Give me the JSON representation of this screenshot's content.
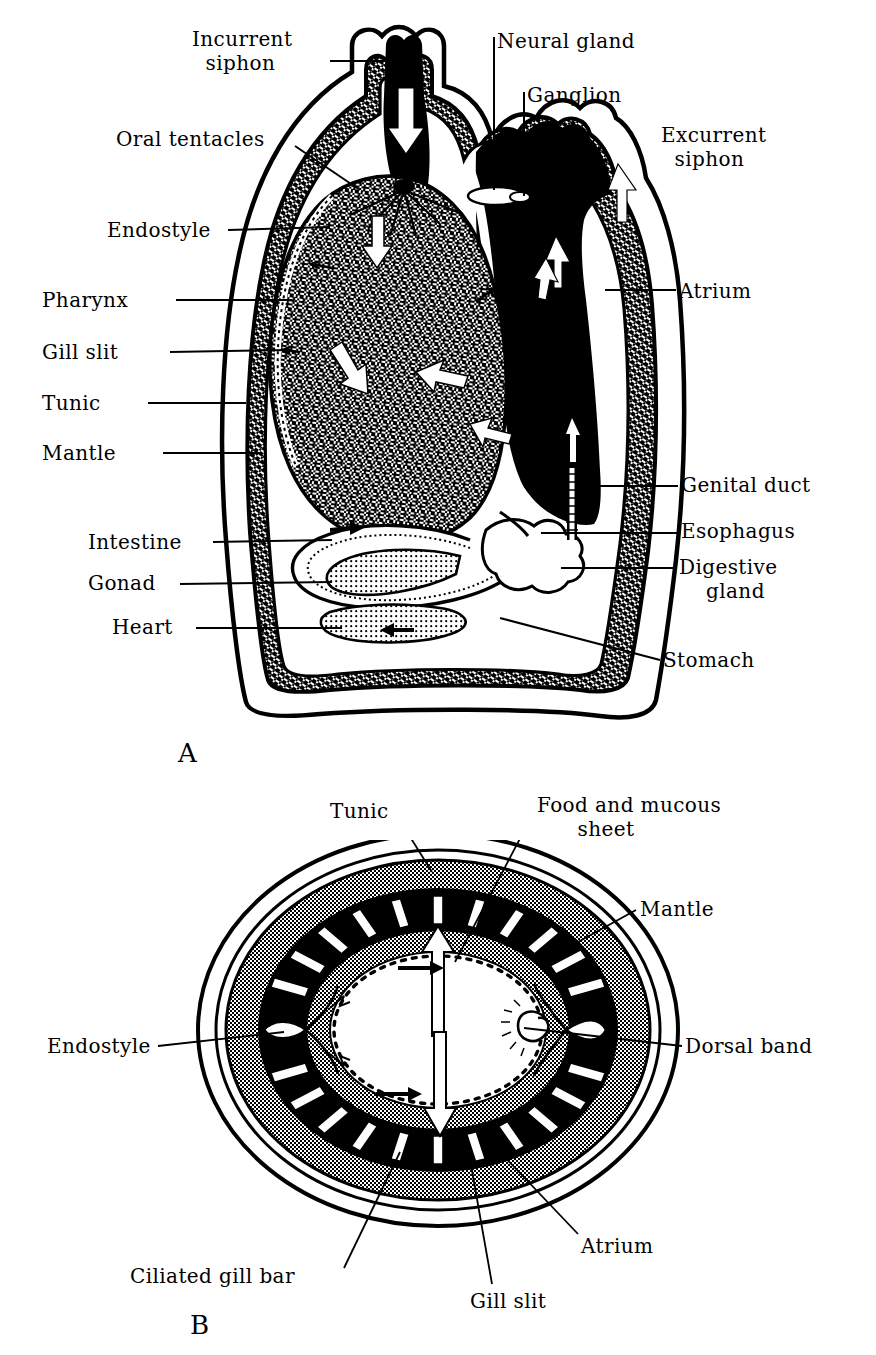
{
  "figure": {
    "panels": [
      {
        "id": "A",
        "letter": "A",
        "view": "longitudinal section",
        "letter_pos": {
          "x": 178,
          "y": 738
        }
      },
      {
        "id": "B",
        "letter": "B",
        "view": "transverse section through pharynx",
        "letter_pos": {
          "x": 190,
          "y": 1310
        }
      }
    ]
  },
  "colors": {
    "ink": "#000000",
    "paper": "#ffffff",
    "halftone_gray": "#8a8a8a",
    "light_gray": "#c9c9c9"
  },
  "panel_a": {
    "labels": [
      {
        "name": "incurrent-siphon",
        "text": "Incurrent\n  siphon",
        "x": 192,
        "y": 28,
        "align": "left",
        "leader": {
          "x1": 330,
          "y1": 61,
          "x2": 404,
          "y2": 61
        }
      },
      {
        "name": "neural-gland",
        "text": "Neural gland",
        "x": 497,
        "y": 30,
        "align": "left",
        "leader": {
          "x1": 494,
          "y1": 37,
          "x2": 494,
          "y2": 190
        }
      },
      {
        "name": "ganglion",
        "text": "Ganglion",
        "x": 527,
        "y": 84,
        "align": "left",
        "leader": {
          "x1": 524,
          "y1": 92,
          "x2": 524,
          "y2": 196
        }
      },
      {
        "name": "excurrent-siphon",
        "text": "Excurrent\n  siphon",
        "x": 661,
        "y": 124,
        "align": "left",
        "leader": null
      },
      {
        "name": "oral-tentacles",
        "text": "Oral tentacles",
        "x": 116,
        "y": 128,
        "align": "left",
        "leader": {
          "x1": 295,
          "y1": 146,
          "x2": 360,
          "y2": 190
        }
      },
      {
        "name": "endostyle",
        "text": "Endostyle",
        "x": 107,
        "y": 219,
        "align": "left",
        "leader": {
          "x1": 228,
          "y1": 230,
          "x2": 325,
          "y2": 228
        }
      },
      {
        "name": "atrium",
        "text": "Atrium",
        "x": 679,
        "y": 280,
        "align": "left",
        "leader": {
          "x1": 605,
          "y1": 290,
          "x2": 676,
          "y2": 290
        }
      },
      {
        "name": "pharynx",
        "text": "Pharynx",
        "x": 42,
        "y": 289,
        "align": "left",
        "leader": {
          "x1": 176,
          "y1": 300,
          "x2": 290,
          "y2": 300
        }
      },
      {
        "name": "gill-slit",
        "text": "Gill slit",
        "x": 42,
        "y": 341,
        "align": "left",
        "leader": {
          "x1": 170,
          "y1": 352,
          "x2": 290,
          "y2": 350
        }
      },
      {
        "name": "tunic",
        "text": "Tunic",
        "x": 42,
        "y": 392,
        "align": "left",
        "leader": {
          "x1": 148,
          "y1": 403,
          "x2": 245,
          "y2": 403
        }
      },
      {
        "name": "mantle",
        "text": "Mantle",
        "x": 42,
        "y": 442,
        "align": "left",
        "leader": {
          "x1": 163,
          "y1": 453,
          "x2": 260,
          "y2": 453
        }
      },
      {
        "name": "genital-duct",
        "text": "Genital duct",
        "x": 681,
        "y": 474,
        "align": "left",
        "leader": {
          "x1": 585,
          "y1": 486,
          "x2": 678,
          "y2": 486
        }
      },
      {
        "name": "esophagus",
        "text": "Esophagus",
        "x": 681,
        "y": 520,
        "align": "left",
        "leader": {
          "x1": 541,
          "y1": 533,
          "x2": 678,
          "y2": 533
        }
      },
      {
        "name": "intestine",
        "text": "Intestine",
        "x": 88,
        "y": 531,
        "align": "left",
        "leader": {
          "x1": 213,
          "y1": 542,
          "x2": 330,
          "y2": 540
        }
      },
      {
        "name": "digestive-gland",
        "text": "Digestive\n    gland",
        "x": 679,
        "y": 556,
        "align": "left",
        "leader": {
          "x1": 561,
          "y1": 568,
          "x2": 676,
          "y2": 568
        }
      },
      {
        "name": "gonad",
        "text": "Gonad",
        "x": 88,
        "y": 572,
        "align": "left",
        "leader": {
          "x1": 180,
          "y1": 584,
          "x2": 330,
          "y2": 582
        }
      },
      {
        "name": "heart",
        "text": "Heart",
        "x": 112,
        "y": 616,
        "align": "left",
        "leader": {
          "x1": 196,
          "y1": 628,
          "x2": 340,
          "y2": 628
        }
      },
      {
        "name": "stomach",
        "text": "Stomach",
        "x": 663,
        "y": 649,
        "align": "left",
        "leader": {
          "x1": 500,
          "y1": 618,
          "x2": 660,
          "y2": 660
        }
      }
    ]
  },
  "panel_b": {
    "labels": [
      {
        "name": "tunic",
        "text": "Tunic",
        "x": 330,
        "y": 800,
        "align": "left",
        "leader": {
          "x1": 402,
          "y1": 824,
          "x2": 432,
          "y2": 872
        }
      },
      {
        "name": "food-and-mucous-sheet",
        "text": "Food and mucous\n      sheet",
        "x": 537,
        "y": 794,
        "align": "left",
        "leader": {
          "x1": 534,
          "y1": 812,
          "x2": 455,
          "y2": 962
        }
      },
      {
        "name": "mantle",
        "text": "Mantle",
        "x": 640,
        "y": 898,
        "align": "left",
        "leader": {
          "x1": 636,
          "y1": 910,
          "x2": 578,
          "y2": 942
        }
      },
      {
        "name": "endostyle",
        "text": "Endostyle",
        "x": 47,
        "y": 1035,
        "align": "left",
        "leader": {
          "x1": 158,
          "y1": 1046,
          "x2": 282,
          "y2": 1032
        }
      },
      {
        "name": "dorsal-band",
        "text": "Dorsal band",
        "x": 685,
        "y": 1035,
        "align": "left",
        "leader": {
          "x1": 524,
          "y1": 1028,
          "x2": 682,
          "y2": 1046
        }
      },
      {
        "name": "atrium",
        "text": "Atrium",
        "x": 581,
        "y": 1235,
        "align": "left",
        "leader": {
          "x1": 578,
          "y1": 1234,
          "x2": 498,
          "y2": 1150
        }
      },
      {
        "name": "ciliated-gill-bar",
        "text": "Ciliated gill bar",
        "x": 130,
        "y": 1265,
        "align": "left",
        "leader": {
          "x1": 344,
          "y1": 1268,
          "x2": 400,
          "y2": 1152
        }
      },
      {
        "name": "gill-slit",
        "text": "Gill slit",
        "x": 470,
        "y": 1290,
        "align": "left",
        "leader": {
          "x1": 492,
          "y1": 1284,
          "x2": 468,
          "y2": 1148
        }
      }
    ]
  },
  "panel_a_flow_arrows": [
    {
      "name": "incurrent-flow-arrow",
      "direction": "down",
      "location": "incurrent siphon"
    },
    {
      "name": "excurrent-flow-arrow",
      "direction": "up",
      "location": "excurrent siphon"
    },
    {
      "name": "pharynx-flow-arrow-1",
      "direction": "down",
      "location": "upper pharynx"
    },
    {
      "name": "pharynx-flow-arrow-2",
      "direction": "down-left",
      "location": "mid pharynx"
    },
    {
      "name": "pharynx-flow-arrow-3",
      "direction": "right",
      "location": "mid pharynx"
    },
    {
      "name": "atrium-flow-arrow-1",
      "direction": "up",
      "location": "atrium upper"
    },
    {
      "name": "atrium-flow-arrow-2",
      "direction": "up",
      "location": "atrium mid"
    },
    {
      "name": "atrium-flow-arrow-3",
      "direction": "up",
      "location": "atrium lower"
    },
    {
      "name": "gut-flow-arrow",
      "direction": "left",
      "location": "intestine"
    }
  ],
  "panel_b_flow_arrows": [
    {
      "name": "dorsal-flow-arrow",
      "direction": "up",
      "location": "top of pharynx"
    },
    {
      "name": "ventral-flow-arrow",
      "direction": "down",
      "location": "bottom of pharynx"
    },
    {
      "name": "ciliary-arrow-top",
      "direction": "right",
      "location": "upper inner ring"
    },
    {
      "name": "ciliary-arrow-bottom",
      "direction": "right",
      "location": "lower inner ring"
    }
  ]
}
